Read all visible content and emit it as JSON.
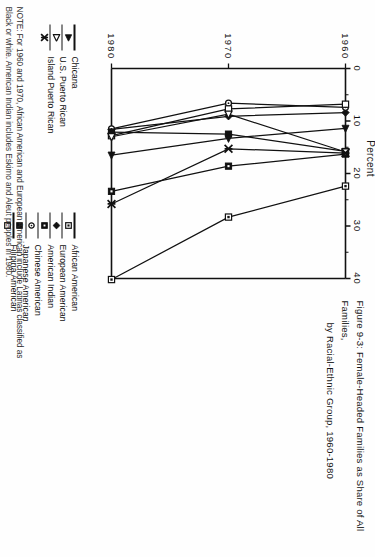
{
  "figure": {
    "title_line1": "Figure 9-3:  Female-Headed Families as Share of All Families,",
    "title_line2": "by Racial-Ethnic Group, 1960-1980",
    "note_line1": "NOTE:  For 1960 and 1970, African American and European American include Latinas classified as",
    "note_line2": "Black or white.  American Indian includes Eskimo and Aleut peoples in 1980."
  },
  "chart_data": {
    "type": "line",
    "title": "Figure 9-3:  Female-Headed Families as Share of All Families, by Racial-Ethnic Group, 1960-1980",
    "xlabel": "Percent",
    "ylabel": "",
    "orientation": "horizontal",
    "x": [
      1960,
      1970,
      1980
    ],
    "xlim": [
      0,
      40
    ],
    "xticks": [
      0,
      10,
      20,
      30,
      40
    ],
    "xtick_labels": [
      "0",
      "10",
      "20",
      "30",
      "40"
    ],
    "ytick_labels": [
      "1960",
      "1970",
      "1980"
    ],
    "grid": false,
    "legend_position": "below",
    "series": [
      {
        "name": "African American",
        "marker": "square-dot-open",
        "values": [
          22.4,
          28.3,
          40.2
        ]
      },
      {
        "name": "European American",
        "marker": "diamond-filled",
        "values": [
          8.4,
          9.1,
          11.6
        ]
      },
      {
        "name": "American Indian",
        "marker": "square-dot-filled",
        "values": [
          16.3,
          18.6,
          23.4
        ]
      },
      {
        "name": "Chinese American",
        "marker": "circle-open",
        "values": [
          7.4,
          6.6,
          11.5
        ]
      },
      {
        "name": "Japanese American",
        "marker": "square-filled",
        "values": [
          15.8,
          12.5,
          12.1
        ]
      },
      {
        "name": "Filipina American",
        "marker": "square-open",
        "values": [
          6.8,
          7.7,
          12.8
        ]
      },
      {
        "name": "Chicana",
        "marker": "triangle-filled",
        "values": [
          11.4,
          13.3,
          16.5
        ]
      },
      {
        "name": "U.S. Puerto Rican",
        "marker": "triangle-open",
        "values": [
          15.9,
          8.7,
          13.0
        ]
      },
      {
        "name": "Island Puerto Rican",
        "marker": "x-star",
        "values": [
          16.1,
          15.3,
          25.8
        ]
      }
    ]
  },
  "legend": {
    "items": [
      {
        "label": "African American",
        "marker": "square-dot-open"
      },
      {
        "label": "European American",
        "marker": "diamond-filled"
      },
      {
        "label": "American Indian",
        "marker": "square-dot-filled"
      },
      {
        "label": "Chinese American",
        "marker": "circle-open"
      },
      {
        "label": "Japanese American",
        "marker": "square-filled"
      },
      {
        "label": "Filipina American",
        "marker": "square-open"
      },
      {
        "label": "Chicana",
        "marker": "triangle-filled"
      },
      {
        "label": "U.S. Puerto Rican",
        "marker": "triangle-open"
      },
      {
        "label": "Island Puerto Rican",
        "marker": "x-star"
      }
    ]
  }
}
